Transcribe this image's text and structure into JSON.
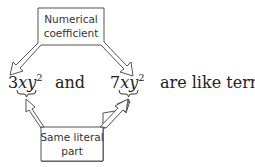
{
  "top_box": {
    "line1": "Numerical",
    "line2": "coefficient"
  },
  "bottom_box": {
    "line1": "Same literal",
    "line2": "part"
  },
  "terms": [
    {
      "coefficient": "3",
      "variables": "xy",
      "exponent": "2"
    },
    {
      "coefficient": "7",
      "variables": "xy",
      "exponent": "2"
    }
  ],
  "connector": "and",
  "conclusion": "are like terms."
}
